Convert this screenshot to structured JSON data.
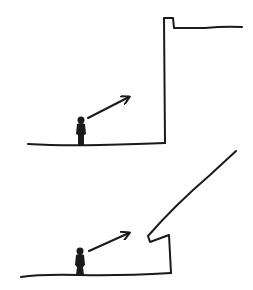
{
  "diagram": {
    "type": "hand-drawn sketch",
    "panels": [
      {
        "id": "top",
        "description": "Person on ground looking up at a tall vertical wall with a small parapet and a flat roof extending right",
        "ink_color": "#1a1a1a",
        "ground": "M28,144 Q60,146 100,145 T165,143",
        "wall": "M165,143 L164,18 L173,18 L174,28 L205,28 Q225,26 242,27",
        "figure": {
          "x": 81,
          "ground_y": 145
        },
        "arrow": {
          "from": [
            88,
            118
          ],
          "to": [
            130,
            97
          ]
        }
      },
      {
        "id": "bottom",
        "description": "Person on ground looking up at a short wall with a lip and a steep slope rising up to the right",
        "ink_color": "#1a1a1a",
        "ground": "M21,277 Q40,274 80,275 T171,273",
        "wall": "M171,273 L169,235 L150,242 L148,236 Q175,205 210,175 L236,151",
        "figure": {
          "x": 80,
          "ground_y": 275
        },
        "arrow": {
          "from": [
            89,
            251
          ],
          "to": [
            130,
            233
          ]
        }
      }
    ]
  }
}
